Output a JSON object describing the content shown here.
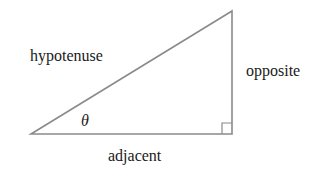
{
  "diagram": {
    "labels": {
      "hypotenuse": "hypotenuse",
      "opposite": "opposite",
      "adjacent": "adjacent",
      "angle": "θ"
    },
    "colors": {
      "line": "#8a8a8a",
      "text": "#1a1a1a",
      "background": "#ffffff"
    },
    "vertices": {
      "angle_vertex": [
        31,
        134
      ],
      "top_vertex": [
        232,
        11
      ],
      "right_angle_vertex": [
        232,
        134
      ]
    }
  }
}
